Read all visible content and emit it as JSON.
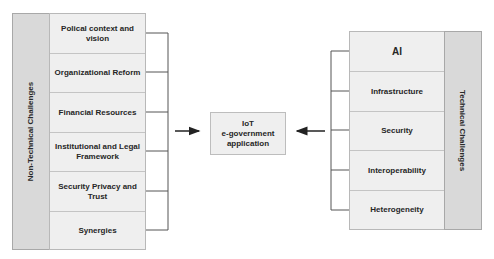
{
  "diagram": {
    "left_group": {
      "label": "Non-Technical Challenges",
      "items": [
        {
          "label": "Polical context and vision"
        },
        {
          "label": "Organizational Reform"
        },
        {
          "label": "Financial Resources"
        },
        {
          "label": "Institutional and Legal Framework"
        },
        {
          "label": "Security Privacy and Trust"
        },
        {
          "label": "Synergies"
        }
      ]
    },
    "center": {
      "line1": "IoT",
      "line2": "e-government",
      "line3": "application"
    },
    "right_group": {
      "label": "Technical Challenges",
      "items": [
        {
          "label": "AI"
        },
        {
          "label": "Infrastructure"
        },
        {
          "label": "Security"
        },
        {
          "label": "Interoperability"
        },
        {
          "label": "Heterogeneity"
        }
      ]
    },
    "colors": {
      "strip": "#d9d9d9",
      "box": "#efefef",
      "line": "#555555"
    }
  }
}
